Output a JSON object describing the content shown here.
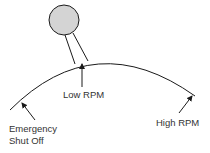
{
  "diagram": {
    "labels": {
      "low_rpm": "Low RPM",
      "high_rpm": "High RPM",
      "emergency_line1": "Emergency",
      "emergency_line2": "Shut Off"
    },
    "colors": {
      "line": "#1a1a1a",
      "knob_fill": "#d4d4d4",
      "text": "#333333"
    }
  }
}
